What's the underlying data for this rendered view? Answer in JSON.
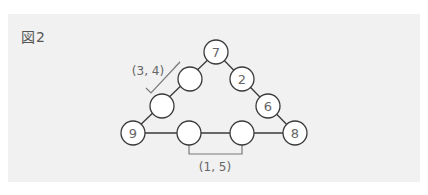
{
  "figure": {
    "label": "図2",
    "nodes": [
      {
        "id": "top",
        "value": "7"
      },
      {
        "id": "left-1",
        "value": ""
      },
      {
        "id": "left-2",
        "value": ""
      },
      {
        "id": "bottom-left",
        "value": "9"
      },
      {
        "id": "right-1",
        "value": "2"
      },
      {
        "id": "right-2",
        "value": "6"
      },
      {
        "id": "bottom-right",
        "value": "8"
      },
      {
        "id": "bottom-1",
        "value": ""
      },
      {
        "id": "bottom-2",
        "value": ""
      }
    ],
    "brackets": {
      "left_side": "(3, 4)",
      "bottom_side": "(1, 5)"
    }
  }
}
